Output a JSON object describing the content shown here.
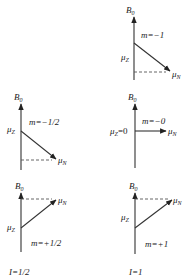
{
  "figure": {
    "field_label": "B",
    "field_sub": "0",
    "moment_label": "μ",
    "moment_sub": "N",
    "z_label": "μ",
    "z_sub": "Z"
  },
  "panels": [
    {
      "id": "I1-m-1",
      "m_label": "m=−1",
      "z_text": ""
    },
    {
      "id": "Ihalf-m-half",
      "m_label": "m=−1/2",
      "z_text": ""
    },
    {
      "id": "I1-m0",
      "m_label": "m=−0",
      "z_text": "=0"
    },
    {
      "id": "Ihalf-m+half",
      "m_label": "m=+1/2",
      "z_text": ""
    },
    {
      "id": "I1-m+1",
      "m_label": "m=+1",
      "z_text": ""
    }
  ],
  "columns": [
    {
      "label": "I=1/2"
    },
    {
      "label": "I=1"
    }
  ]
}
